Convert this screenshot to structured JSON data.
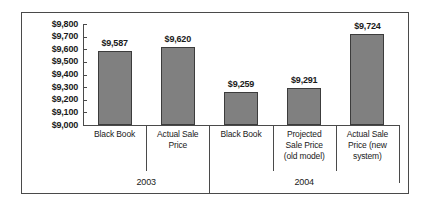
{
  "chart_data": {
    "type": "bar",
    "title": "",
    "subtitle": "",
    "xlabel": "",
    "ylabel": "",
    "ylim": [
      9000,
      9800
    ],
    "ytick_step": 100,
    "grid": false,
    "legend": null,
    "bar_color": "#808080",
    "bar_border_color": "#3c3c3c",
    "axis_color": "#4a4a4a",
    "frame_color": "#4a4a4a",
    "ytick_labels": [
      "$9,800",
      "$9,700",
      "$9,600",
      "$9,500",
      "$9,400",
      "$9,300",
      "$9,200",
      "$9,100",
      "$9,000"
    ],
    "ytick_values": [
      9800,
      9700,
      9600,
      9500,
      9400,
      9300,
      9200,
      9100,
      9000
    ],
    "groups": [
      {
        "label": "2003",
        "category_count": 2
      },
      {
        "label": "2004",
        "category_count": 3
      }
    ],
    "categories": [
      "Black Book",
      "Actual Sale Price",
      "Black Book",
      "Projected Sale Price (old model)",
      "Actual Sale Price (new system)"
    ],
    "category_lines": [
      [
        "Black Book"
      ],
      [
        "Actual Sale",
        "Price"
      ],
      [
        "Black Book"
      ],
      [
        "Projected",
        "Sale Price",
        "(old model)"
      ],
      [
        "Actual Sale",
        "Price (new",
        "system)"
      ]
    ],
    "values": [
      9587,
      9620,
      9259,
      9291,
      9724
    ],
    "data_labels": [
      "$9,587",
      "$9,620",
      "$9,259",
      "$9,291",
      "$9,724"
    ]
  }
}
